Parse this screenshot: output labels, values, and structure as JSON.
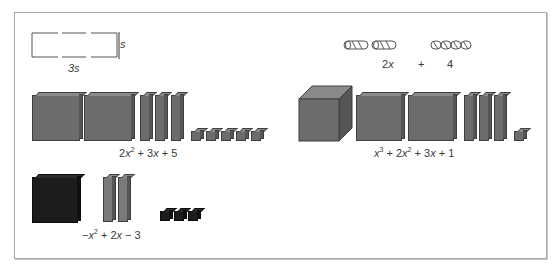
{
  "figure": {
    "rectangle_model": {
      "width_label": "3s",
      "height_label": "s"
    },
    "cylinder_model": {
      "long_count": 2,
      "short_count": 4,
      "terms": [
        "2x",
        "+",
        "4"
      ]
    },
    "polynomials": [
      {
        "id": "poly-a",
        "expression": "2x² + 3x + 5",
        "tiles": {
          "x_squared": 2,
          "x": 3,
          "unit": 5
        },
        "color": "#6c6c6c"
      },
      {
        "id": "poly-b",
        "expression": "x³ + 2x² + 3x + 1",
        "tiles": {
          "x_cubed": 1,
          "x_squared": 2,
          "x": 3,
          "unit": 1
        },
        "color": "#6c6c6c"
      },
      {
        "id": "poly-c",
        "expression": "−x² + 2x − 3",
        "tiles": {
          "neg_x_squared": 1,
          "x": 2,
          "neg_unit": 3
        },
        "positive_color": "#7a7a7a",
        "negative_color": "#1c1c1c"
      }
    ],
    "colors": {
      "border": "#a8a8a8",
      "tile_positive": "#6c6c6c",
      "tile_negative": "#1c1c1c",
      "text": "#3a3a3a"
    }
  }
}
